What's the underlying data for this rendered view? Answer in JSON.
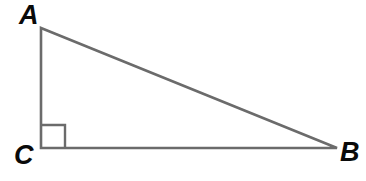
{
  "figure": {
    "type": "geometry-diagram",
    "shape": "right-triangle",
    "background_color": "#ffffff",
    "stroke_color": "#6b6b6b",
    "label_color": "#0a0a0a",
    "stroke_width": 2.6,
    "canvas": {
      "width": 366,
      "height": 181
    }
  },
  "vertices": {
    "A": {
      "label": "A",
      "x": 41,
      "y": 28
    },
    "B": {
      "label": "B",
      "x": 337,
      "y": 148
    },
    "C": {
      "label": "C",
      "x": 41,
      "y": 148
    }
  },
  "labels": {
    "a": "A",
    "b": "B",
    "c": "C"
  },
  "sides": {
    "leg_vertical": {
      "from": "A",
      "to": "C"
    },
    "leg_horizontal": {
      "from": "C",
      "to": "B"
    },
    "hypotenuse": {
      "from": "A",
      "to": "B"
    }
  },
  "right_angle": {
    "at_vertex": "C",
    "marker": "square",
    "size": 24
  },
  "chart_data": {
    "type": "scatter",
    "title": "",
    "xlabel": "",
    "ylabel": "",
    "grid": false,
    "legend": "none",
    "points": [
      {
        "name": "A",
        "x": 41,
        "y": 28
      },
      {
        "name": "C",
        "x": 41,
        "y": 148
      },
      {
        "name": "B",
        "x": 337,
        "y": 148
      }
    ]
  }
}
